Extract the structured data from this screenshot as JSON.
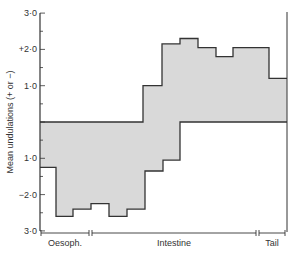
{
  "chart_data": {
    "type": "area",
    "title": "",
    "ylabel": "Mean undulations (+ or −)",
    "xlabel": "",
    "ylim": [
      -3.0,
      3.0
    ],
    "y_ticks": [
      {
        "value": 3.0,
        "label": "3·0"
      },
      {
        "value": 2.0,
        "label": "+2·0"
      },
      {
        "value": 1.0,
        "label": "1·0"
      },
      {
        "value": -1.0,
        "label": "1·0"
      },
      {
        "value": -2.0,
        "label": "−2·0"
      },
      {
        "value": -3.0,
        "label": "3·0"
      }
    ],
    "grid": false,
    "legend": null,
    "x_segments": [
      {
        "label": "Oesoph.",
        "start": 0,
        "end": 50
      },
      {
        "label": "Intestine",
        "start": 50,
        "end": 217
      },
      {
        "label": "Tail",
        "start": 217,
        "end": 247
      }
    ],
    "series": [
      {
        "name": "upper (positive undulations)",
        "steps": [
          {
            "x0": 0,
            "x1": 103,
            "value": 0.0
          },
          {
            "x0": 103,
            "x1": 122,
            "value": 1.0
          },
          {
            "x0": 122,
            "x1": 140,
            "value": 2.15
          },
          {
            "x0": 140,
            "x1": 158,
            "value": 2.3
          },
          {
            "x0": 158,
            "x1": 176,
            "value": 2.05
          },
          {
            "x0": 176,
            "x1": 193,
            "value": 1.8
          },
          {
            "x0": 193,
            "x1": 229,
            "value": 2.05
          },
          {
            "x0": 229,
            "x1": 247,
            "value": 1.2
          }
        ]
      },
      {
        "name": "lower (negative undulations)",
        "steps": [
          {
            "x0": 0,
            "x1": 16,
            "value": -1.25
          },
          {
            "x0": 16,
            "x1": 33,
            "value": -2.6
          },
          {
            "x0": 33,
            "x1": 51,
            "value": -2.4
          },
          {
            "x0": 51,
            "x1": 69,
            "value": -2.25
          },
          {
            "x0": 69,
            "x1": 87,
            "value": -2.6
          },
          {
            "x0": 87,
            "x1": 105,
            "value": -2.4
          },
          {
            "x0": 105,
            "x1": 123,
            "value": -1.35
          },
          {
            "x0": 123,
            "x1": 140,
            "value": -1.05
          },
          {
            "x0": 140,
            "x1": 247,
            "value": 0.0
          }
        ]
      }
    ],
    "fill_color": "#d9d9d9",
    "line_color": "#333333"
  }
}
